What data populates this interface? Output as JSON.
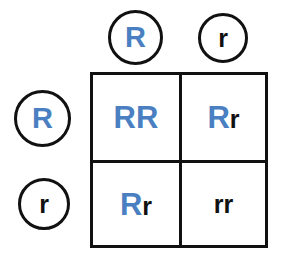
{
  "diagram": {
    "type": "punnett-square",
    "colors": {
      "dominant_allele": "#4a7fc1",
      "recessive_allele": "#111111",
      "border": "#111111",
      "background": "#ffffff"
    },
    "top_gametes": [
      {
        "label": "R",
        "type": "dominant"
      },
      {
        "label": "r",
        "type": "recessive"
      }
    ],
    "left_gametes": [
      {
        "label": "R",
        "type": "dominant"
      },
      {
        "label": "r",
        "type": "recessive"
      }
    ],
    "cells": [
      {
        "row": 0,
        "col": 0,
        "genotype": "RR",
        "first": {
          "label": "R",
          "type": "dominant"
        },
        "second": {
          "label": "R",
          "type": "dominant"
        }
      },
      {
        "row": 0,
        "col": 1,
        "genotype": "Rr",
        "first": {
          "label": "R",
          "type": "dominant"
        },
        "second": {
          "label": "r",
          "type": "recessive"
        }
      },
      {
        "row": 1,
        "col": 0,
        "genotype": "Rr",
        "first": {
          "label": "R",
          "type": "dominant"
        },
        "second": {
          "label": "r",
          "type": "recessive"
        }
      },
      {
        "row": 1,
        "col": 1,
        "genotype": "rr",
        "first": {
          "label": "r",
          "type": "recessive"
        },
        "second": {
          "label": "r",
          "type": "recessive"
        }
      }
    ]
  }
}
